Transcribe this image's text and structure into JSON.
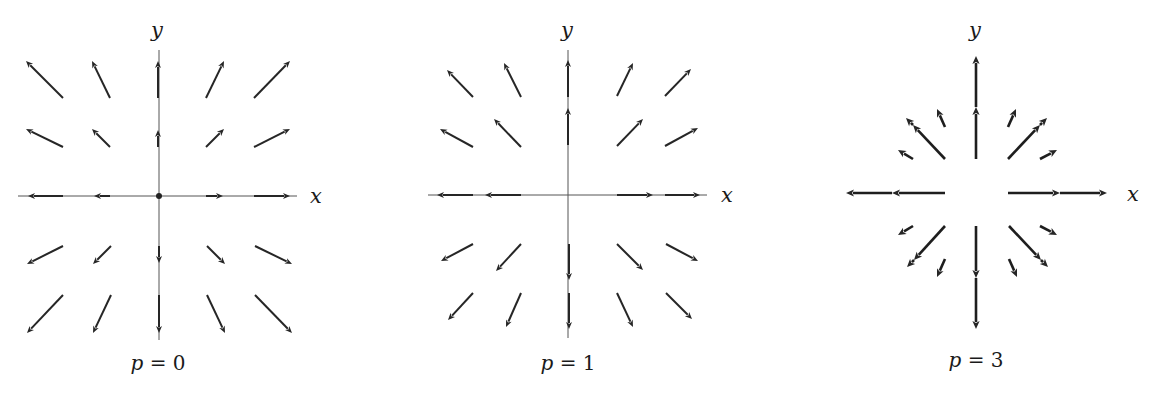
{
  "figure": {
    "colors": {
      "vector": "#262626",
      "axis": "#555555",
      "text": "#1a1a1a",
      "background": "#ffffff"
    },
    "panels": [
      {
        "id": "p0",
        "caption_var": "p",
        "caption_eq": " = ",
        "caption_val": "0",
        "x_label": "x",
        "y_label": "y",
        "origin": [
          159,
          196
        ],
        "origin_dot": true,
        "axis_extent": {
          "x": [
            18,
            297
          ],
          "y": [
            50,
            340
          ]
        },
        "x_label_pos": [
          316,
          203
        ],
        "y_label_pos": [
          157,
          37
        ],
        "caption_pos": [
          158,
          370
        ],
        "arrows": [
          {
            "from": [
              63,
              98
            ],
            "to": [
              26,
              61
            ]
          },
          {
            "from": [
              110,
              98
            ],
            "to": [
              92,
              61
            ]
          },
          {
            "from": [
              158,
              98
            ],
            "to": [
              158,
              61
            ]
          },
          {
            "from": [
              206,
              98
            ],
            "to": [
              224,
              61
            ]
          },
          {
            "from": [
              254,
              98
            ],
            "to": [
              290,
              61
            ]
          },
          {
            "from": [
              63,
              147
            ],
            "to": [
              26,
              129
            ]
          },
          {
            "from": [
              110,
              147
            ],
            "to": [
              92,
              129
            ]
          },
          {
            "from": [
              158,
              147
            ],
            "to": [
              158,
              130
            ]
          },
          {
            "from": [
              206,
              147
            ],
            "to": [
              224,
              129
            ]
          },
          {
            "from": [
              254,
              147
            ],
            "to": [
              290,
              129
            ]
          },
          {
            "from": [
              63,
              196
            ],
            "to": [
              28,
              196
            ]
          },
          {
            "from": [
              110,
              196
            ],
            "to": [
              94,
              196
            ]
          },
          {
            "from": [
              206,
              196
            ],
            "to": [
              223,
              196
            ]
          },
          {
            "from": [
              254,
              196
            ],
            "to": [
              290,
              196
            ]
          },
          {
            "from": [
              63,
              246
            ],
            "to": [
              27,
              264
            ]
          },
          {
            "from": [
              111,
              246
            ],
            "to": [
              93,
              264
            ]
          },
          {
            "from": [
              159,
              246
            ],
            "to": [
              159,
              263
            ]
          },
          {
            "from": [
              207,
              246
            ],
            "to": [
              225,
              264
            ]
          },
          {
            "from": [
              255,
              246
            ],
            "to": [
              292,
              264
            ]
          },
          {
            "from": [
              63,
              295
            ],
            "to": [
              27,
              333
            ]
          },
          {
            "from": [
              111,
              295
            ],
            "to": [
              93,
              333
            ]
          },
          {
            "from": [
              159,
              295
            ],
            "to": [
              159,
              333
            ]
          },
          {
            "from": [
              207,
              295
            ],
            "to": [
              225,
              333
            ]
          },
          {
            "from": [
              255,
              295
            ],
            "to": [
              292,
              333
            ]
          }
        ]
      },
      {
        "id": "p1",
        "caption_var": "p",
        "caption_eq": " = ",
        "caption_val": "1",
        "x_label": "x",
        "y_label": "y",
        "origin": [
          568,
          195
        ],
        "origin_dot": false,
        "axis_extent": {
          "x": [
            428,
            707
          ],
          "y": [
            50,
            338
          ]
        },
        "x_label_pos": [
          727,
          202
        ],
        "y_label_pos": [
          567,
          37
        ],
        "caption_pos": [
          568,
          370
        ],
        "arrows": [
          {
            "from": [
              473,
              97
            ],
            "to": [
              447,
              70
            ]
          },
          {
            "from": [
              521,
              97
            ],
            "to": [
              504,
              63
            ]
          },
          {
            "from": [
              568,
              97
            ],
            "to": [
              568,
              60
            ]
          },
          {
            "from": [
              617,
              96
            ],
            "to": [
              633,
              63
            ]
          },
          {
            "from": [
              665,
              96
            ],
            "to": [
              691,
              69
            ]
          },
          {
            "from": [
              473,
              147
            ],
            "to": [
              440,
              129
            ]
          },
          {
            "from": [
              521,
              147
            ],
            "to": [
              494,
              119
            ]
          },
          {
            "from": [
              568,
              145
            ],
            "to": [
              568,
              108
            ]
          },
          {
            "from": [
              617,
              146
            ],
            "to": [
              643,
              119
            ]
          },
          {
            "from": [
              665,
              146
            ],
            "to": [
              698,
              128
            ]
          },
          {
            "from": [
              473,
              195
            ],
            "to": [
              437,
              195
            ]
          },
          {
            "from": [
              521,
              195
            ],
            "to": [
              485,
              195
            ]
          },
          {
            "from": [
              617,
              195
            ],
            "to": [
              653,
              195
            ]
          },
          {
            "from": [
              665,
              195
            ],
            "to": [
              700,
              195
            ]
          },
          {
            "from": [
              473,
              244
            ],
            "to": [
              441,
              261
            ]
          },
          {
            "from": [
              521,
              244
            ],
            "to": [
              496,
              271
            ]
          },
          {
            "from": [
              569,
              244
            ],
            "to": [
              569,
              280
            ]
          },
          {
            "from": [
              617,
              244
            ],
            "to": [
              643,
              270
            ]
          },
          {
            "from": [
              666,
              244
            ],
            "to": [
              698,
              261
            ]
          },
          {
            "from": [
              473,
              293
            ],
            "to": [
              448,
              320
            ]
          },
          {
            "from": [
              521,
              293
            ],
            "to": [
              506,
              327
            ]
          },
          {
            "from": [
              569,
              293
            ],
            "to": [
              569,
              329
            ]
          },
          {
            "from": [
              617,
              293
            ],
            "to": [
              633,
              327
            ]
          },
          {
            "from": [
              666,
              293
            ],
            "to": [
              692,
              319
            ]
          }
        ]
      },
      {
        "id": "p3",
        "caption_var": "p",
        "caption_eq": " = ",
        "caption_val": "3",
        "x_label": "x",
        "y_label": "y",
        "origin": [
          976,
          193
        ],
        "origin_dot": false,
        "axis_extent": null,
        "x_label_pos": [
          1133,
          201
        ],
        "y_label_pos": [
          975,
          37
        ],
        "caption_pos": [
          976,
          367
        ],
        "arrows": [
          {
            "from": [
              976,
              159
            ],
            "to": [
              976,
              107
            ],
            "thick": true
          },
          {
            "from": [
              976,
              107
            ],
            "to": [
              976,
              56
            ],
            "thick": true
          },
          {
            "from": [
              945,
              159
            ],
            "to": [
              913,
              125
            ],
            "thick": true
          },
          {
            "from": [
              913,
              125
            ],
            "to": [
              906,
              118
            ],
            "thick": true
          },
          {
            "from": [
              1008,
              159
            ],
            "to": [
              1040,
              125
            ],
            "thick": true
          },
          {
            "from": [
              1040,
              125
            ],
            "to": [
              1047,
              118
            ],
            "thick": true
          },
          {
            "from": [
              945,
              127
            ],
            "to": [
              937,
              109
            ],
            "thick": true
          },
          {
            "from": [
              1008,
              127
            ],
            "to": [
              1016,
              109
            ],
            "thick": true
          },
          {
            "from": [
              913,
              159
            ],
            "to": [
              898,
              150
            ],
            "thick": true
          },
          {
            "from": [
              1040,
              159
            ],
            "to": [
              1057,
              150
            ],
            "thick": true
          },
          {
            "from": [
              945,
              193
            ],
            "to": [
              892,
              193
            ],
            "thick": true
          },
          {
            "from": [
              892,
              193
            ],
            "to": [
              846,
              193
            ],
            "thick": true
          },
          {
            "from": [
              1008,
              193
            ],
            "to": [
              1060,
              193
            ],
            "thick": true
          },
          {
            "from": [
              1060,
              193
            ],
            "to": [
              1107,
              193
            ],
            "thick": true
          },
          {
            "from": [
              976,
              226
            ],
            "to": [
              976,
              278
            ],
            "thick": true
          },
          {
            "from": [
              976,
              278
            ],
            "to": [
              976,
              329
            ],
            "thick": true
          },
          {
            "from": [
              945,
              226
            ],
            "to": [
              914,
              260
            ],
            "thick": true
          },
          {
            "from": [
              914,
              260
            ],
            "to": [
              907,
              267
            ],
            "thick": true
          },
          {
            "from": [
              1009,
              226
            ],
            "to": [
              1041,
              260
            ],
            "thick": true
          },
          {
            "from": [
              1041,
              260
            ],
            "to": [
              1048,
              267
            ],
            "thick": true
          },
          {
            "from": [
              913,
              226
            ],
            "to": [
              898,
              235
            ],
            "thick": true
          },
          {
            "from": [
              1040,
              226
            ],
            "to": [
              1057,
              235
            ],
            "thick": true
          },
          {
            "from": [
              945,
              259
            ],
            "to": [
              937,
              277
            ],
            "thick": true
          },
          {
            "from": [
              1009,
              259
            ],
            "to": [
              1017,
              277
            ],
            "thick": true
          }
        ]
      }
    ]
  }
}
